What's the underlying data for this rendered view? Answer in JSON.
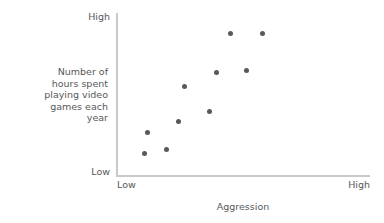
{
  "chart_data": {
    "type": "scatter",
    "title": "",
    "xlabel": "Aggression",
    "ylabel": "Number of hours spent playing video games each year",
    "ylabel_lines": [
      "Number of",
      "hours spent",
      "playing video",
      "games each",
      "year"
    ],
    "x_tick_labels": [
      "Low",
      "High"
    ],
    "y_tick_labels": [
      "Low",
      "High"
    ],
    "xlim": [
      "Low",
      "High"
    ],
    "ylim": [
      "Low",
      "High"
    ],
    "grid": false,
    "legend": "none",
    "point_color": "#58585a",
    "axis_color": "#c9c9cb",
    "point_count": 10,
    "points": [
      {
        "x": 0.118,
        "y": 0.265
      },
      {
        "x": 0.107,
        "y": 0.13
      },
      {
        "x": 0.194,
        "y": 0.16
      },
      {
        "x": 0.242,
        "y": 0.33
      },
      {
        "x": 0.262,
        "y": 0.545
      },
      {
        "x": 0.365,
        "y": 0.395
      },
      {
        "x": 0.389,
        "y": 0.635
      },
      {
        "x": 0.448,
        "y": 0.875
      },
      {
        "x": 0.508,
        "y": 0.645
      },
      {
        "x": 0.575,
        "y": 0.875
      }
    ]
  }
}
